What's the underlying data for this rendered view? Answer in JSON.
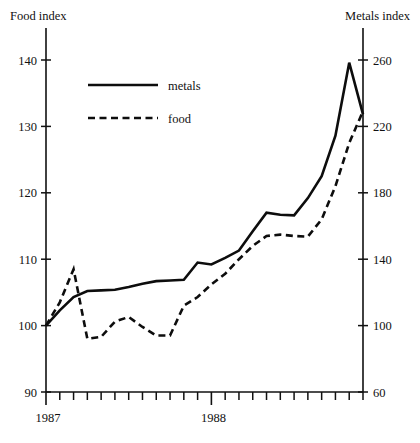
{
  "chart_data": {
    "type": "line",
    "title": "",
    "xlabel": "",
    "ylabel": "Food index",
    "y2label": "Metals index",
    "grid": false,
    "legend_position": "upper-left-inside",
    "x": [
      0,
      1,
      2,
      3,
      4,
      5,
      6,
      7,
      8,
      9,
      10,
      11,
      12,
      13,
      14,
      15,
      16,
      17,
      18,
      19,
      20,
      21,
      22,
      23
    ],
    "x_tick_labels": [
      "1987",
      "1988"
    ],
    "x_tick_label_positions": [
      0,
      12
    ],
    "x_minor_tick_count": 24,
    "ylim": [
      90,
      140
    ],
    "yticks": [
      90,
      100,
      110,
      120,
      130,
      140
    ],
    "ytick_labels": [
      "90",
      "100",
      "110",
      "120",
      "130",
      "140"
    ],
    "y2lim": [
      60,
      260
    ],
    "y2ticks": [
      60,
      100,
      140,
      180,
      220,
      260
    ],
    "y2tick_labels": [
      "60",
      "100",
      "140",
      "180",
      "220",
      "260"
    ],
    "series": [
      {
        "name": "metals",
        "style": "solid",
        "axis": "right",
        "axis_label": "Metals index",
        "values_food_scale": [
          100.0,
          102.3,
          104.3,
          105.2,
          105.3,
          105.4,
          105.8,
          106.3,
          106.7,
          106.8,
          106.9,
          109.5,
          109.2,
          110.2,
          111.3,
          114.2,
          117.0,
          116.7,
          116.6,
          119.2,
          122.5,
          128.6,
          139.6,
          131.8
        ],
        "values": [
          260.0,
          269.2,
          277.2,
          280.8,
          281.2,
          281.6,
          283.2,
          285.2,
          286.8,
          287.2,
          287.6,
          298.0,
          296.8,
          300.8,
          305.2,
          316.8,
          328.0,
          326.8,
          326.4,
          336.8,
          350.0,
          374.4,
          418.4,
          387.2
        ]
      },
      {
        "name": "food",
        "style": "dashed",
        "axis": "left",
        "axis_label": "Food index",
        "values": [
          100.0,
          103.5,
          108.5,
          98.0,
          98.3,
          100.6,
          101.3,
          99.8,
          98.5,
          98.5,
          103.0,
          104.3,
          106.2,
          107.8,
          110.0,
          112.0,
          113.5,
          113.7,
          113.5,
          113.4,
          116.0,
          121.0,
          127.5,
          132.3
        ]
      }
    ],
    "legend": [
      {
        "label": "metals",
        "style": "solid"
      },
      {
        "label": "food",
        "style": "dashed"
      }
    ]
  },
  "labels": {
    "left_axis_title": "Food index",
    "right_axis_title": "Metals index"
  }
}
